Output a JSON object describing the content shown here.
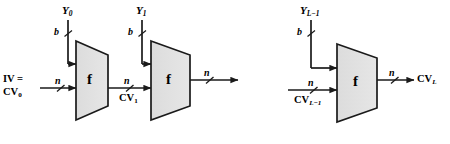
{
  "figure": {
    "type": "block-diagram",
    "background": "#ffffff",
    "block_fill": "#e0e0e0",
    "stroke": "#1a1a1a"
  },
  "blocks": [
    {
      "id": "f0",
      "label": "f"
    },
    {
      "id": "f1",
      "label": "f"
    },
    {
      "id": "fL",
      "label": "f"
    }
  ],
  "stages": [
    {
      "message_label": "Y",
      "message_sub": "0",
      "bit_label": "b",
      "input_width_label": "n",
      "input_name_line1": "IV =",
      "input_name_line2": "CV",
      "input_name_sub": "0",
      "output_width_label": "n",
      "output_name": "CV",
      "output_sub": "1"
    },
    {
      "message_label": "Y",
      "message_sub": "1",
      "bit_label": "b",
      "input_width_label": "n",
      "output_width_label": "n"
    },
    {
      "message_label": "Y",
      "message_sub": "L−1",
      "bit_label": "b",
      "input_width_label": "n",
      "input_name": "CV",
      "input_name_sub": "L−1",
      "output_width_label": "n",
      "output_name": "CV",
      "output_sub": "L"
    }
  ],
  "labels": {
    "y0": "Y",
    "y0_sub": "0",
    "y1": "Y",
    "y1_sub": "1",
    "yL": "Y",
    "yL_sub": "L−1",
    "b": "b",
    "n": "n",
    "iv_line1": "IV =",
    "cv0": "CV",
    "cv0_sub": "0",
    "cv1": "CV",
    "cv1_sub": "1",
    "cvLm1": "CV",
    "cvLm1_sub": "L−1",
    "cvL": "CV",
    "cvL_sub": "L",
    "f": "f"
  }
}
